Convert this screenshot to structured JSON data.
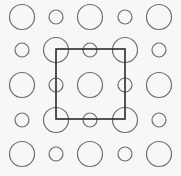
{
  "diagram": {
    "title": "",
    "background": "#f7f7f5",
    "stroke_color": "#6e6e6e",
    "square_color": "#2a2a2a",
    "columns_x": [
      22,
      56,
      90,
      125,
      159
    ],
    "rows_y": [
      17,
      50,
      85,
      120,
      154
    ],
    "radius": {
      "L": 12.5,
      "S": 7
    },
    "grid": [
      [
        "L",
        "S",
        "L",
        "S",
        "L"
      ],
      [
        "S",
        "L",
        "S",
        "L",
        "S"
      ],
      [
        "L",
        "S",
        "L",
        "S",
        "L"
      ],
      [
        "S",
        "L",
        "S",
        "L",
        "S"
      ],
      [
        "L",
        "S",
        "L",
        "S",
        "L"
      ]
    ],
    "square": {
      "x": 56,
      "y": 49,
      "width": 69,
      "height": 70
    }
  }
}
